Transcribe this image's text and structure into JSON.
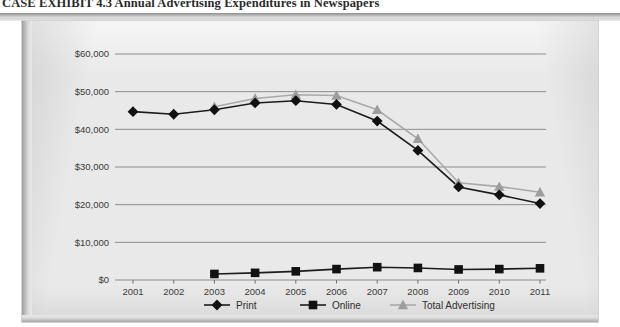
{
  "caption": "CASE EXHIBIT 4.3  Annual Advertising Expenditures in Newspapers",
  "chart_data": {
    "type": "line",
    "title": "Annual Advertising Expenditures in Newspapers",
    "xlabel": "",
    "ylabel": "",
    "ylim": [
      0,
      60000
    ],
    "yticks": [
      0,
      10000,
      20000,
      30000,
      40000,
      50000,
      60000
    ],
    "ytick_labels": [
      "$0",
      "$10,000",
      "$20,000",
      "$30,000",
      "$40,000",
      "$50,000",
      "$60,000"
    ],
    "grid": true,
    "legend_position": "bottom",
    "categories": [
      "2001",
      "2002",
      "2003",
      "2004",
      "2005",
      "2006",
      "2007",
      "2008",
      "2009",
      "2010",
      "2011"
    ],
    "series": [
      {
        "name": "Print",
        "marker": "diamond",
        "color": "#111111",
        "values": [
          44700,
          44000,
          45200,
          47000,
          47600,
          46600,
          42200,
          34400,
          24700,
          22600,
          20300
        ]
      },
      {
        "name": "Online",
        "marker": "square",
        "color": "#111111",
        "values": [
          null,
          null,
          1600,
          1900,
          2300,
          2900,
          3400,
          3200,
          2800,
          2900,
          3100
        ]
      },
      {
        "name": "Total Advertising",
        "marker": "triangle",
        "color": "#9d9d9d",
        "values": [
          null,
          null,
          46000,
          48200,
          49200,
          49000,
          45200,
          37500,
          25800,
          24800,
          23300
        ]
      }
    ]
  },
  "legend": {
    "items": [
      {
        "label": "Print"
      },
      {
        "label": "Online"
      },
      {
        "label": "Total Advertising"
      }
    ]
  },
  "colors": {
    "plate_background": "#e9e9e9",
    "gridline": "#8d8d8d",
    "dark_series": "#111111",
    "gray_series": "#9d9d9d"
  }
}
